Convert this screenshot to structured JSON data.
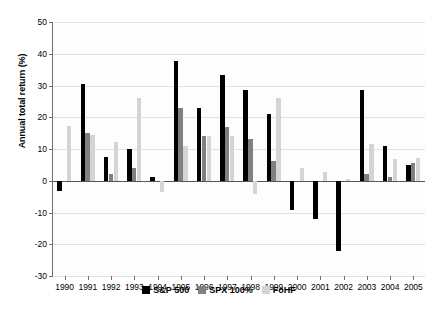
{
  "chart_data": {
    "type": "bar",
    "title": "",
    "xlabel": "",
    "ylabel": "Annual total return (%)",
    "ylim": [
      -30,
      50
    ],
    "ytick_step": 10,
    "yticks": [
      50,
      40,
      30,
      20,
      10,
      0,
      -10,
      -20,
      -30
    ],
    "grid": true,
    "legend_position": "bottom",
    "categories": [
      "1990",
      "1991",
      "1992",
      "1993",
      "1994",
      "1995",
      "1996",
      "1997",
      "1998",
      "1999",
      "2000",
      "2001",
      "2002",
      "2003",
      "2004",
      "2005"
    ],
    "series": [
      {
        "name": "S&P 500",
        "color": "#000000",
        "values": [
          -3.1,
          30.5,
          7.6,
          10.1,
          1.3,
          37.6,
          23.0,
          33.4,
          28.6,
          21.0,
          -9.1,
          -11.9,
          -22.1,
          28.7,
          10.9,
          4.9
        ]
      },
      {
        "name": "SPX 100%",
        "color": "#808080",
        "values": [
          0.0,
          15.1,
          2.1,
          4.0,
          0.0,
          23.0,
          14.0,
          17.0,
          13.0,
          6.2,
          0.0,
          0.0,
          0.0,
          2.2,
          1.1,
          5.7
        ]
      },
      {
        "name": "FoHF",
        "color": "#d4d4d4",
        "values": [
          17.2,
          14.3,
          12.1,
          26.0,
          -3.5,
          11.0,
          14.0,
          14.1,
          -4.1,
          26.1,
          4.0,
          2.8,
          0.7,
          11.6,
          6.9,
          7.3
        ]
      }
    ]
  },
  "legend": {
    "items": [
      {
        "label": "S&P 500"
      },
      {
        "label": "SPX 100%"
      },
      {
        "label": "FoHF"
      }
    ]
  }
}
